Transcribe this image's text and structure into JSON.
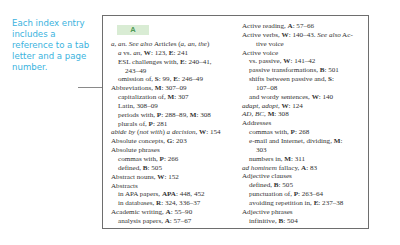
{
  "callout": {
    "text": "Each index entry includes a reference to a tab letter and a page number."
  },
  "index": {
    "tab_letter": "A",
    "left_column": [
      {
        "level": 0,
        "parts": [
          [
            "i",
            "a, an. See also "
          ],
          [
            "",
            "Articles ("
          ],
          [
            "i",
            "a, an, the"
          ],
          [
            "",
            ")"
          ]
        ]
      },
      {
        "level": 1,
        "parts": [
          [
            "i",
            "a"
          ],
          [
            "",
            " vs. "
          ],
          [
            "i",
            "an"
          ],
          [
            "",
            ", "
          ],
          [
            "b",
            "W"
          ],
          [
            "",
            ": 123, "
          ],
          [
            "b",
            "E"
          ],
          [
            "",
            ": 241"
          ]
        ]
      },
      {
        "level": 1,
        "parts": [
          [
            "",
            "ESL challenges with, "
          ],
          [
            "b",
            "E"
          ],
          [
            "",
            ": 240–41,"
          ]
        ]
      },
      {
        "level": 2,
        "parts": [
          [
            "",
            "243–49"
          ]
        ]
      },
      {
        "level": 1,
        "parts": [
          [
            "",
            "omission of, "
          ],
          [
            "b",
            "S"
          ],
          [
            "",
            ": 99, "
          ],
          [
            "b",
            "E"
          ],
          [
            "",
            ": 246–49"
          ]
        ]
      },
      {
        "level": 0,
        "parts": [
          [
            "",
            "Abbreviations, "
          ],
          [
            "b",
            "M"
          ],
          [
            "",
            ": 307–09"
          ]
        ]
      },
      {
        "level": 1,
        "parts": [
          [
            "",
            "capitalization of, "
          ],
          [
            "b",
            "M"
          ],
          [
            "",
            ": 307"
          ]
        ]
      },
      {
        "level": 1,
        "parts": [
          [
            "",
            "Latin, 308–09"
          ]
        ]
      },
      {
        "level": 1,
        "parts": [
          [
            "",
            "periods with, "
          ],
          [
            "b",
            "P"
          ],
          [
            "",
            ": 288–89, "
          ],
          [
            "b",
            "M"
          ],
          [
            "",
            ": 308"
          ]
        ]
      },
      {
        "level": 1,
        "parts": [
          [
            "",
            "plurals of, "
          ],
          [
            "b",
            "P"
          ],
          [
            "",
            ": 281"
          ]
        ]
      },
      {
        "level": 0,
        "parts": [
          [
            "i",
            "abide by"
          ],
          [
            "",
            " ("
          ],
          [
            "i",
            "not with"
          ],
          [
            "",
            ") "
          ],
          [
            "i",
            "a decision"
          ],
          [
            "",
            ", "
          ],
          [
            "b",
            "W"
          ],
          [
            "",
            ": 154"
          ]
        ]
      },
      {
        "level": 0,
        "parts": [
          [
            "",
            "Absolute concepts, "
          ],
          [
            "b",
            "G"
          ],
          [
            "",
            ": 203"
          ]
        ]
      },
      {
        "level": 0,
        "parts": [
          [
            "",
            "Absolute phrases"
          ]
        ]
      },
      {
        "level": 1,
        "parts": [
          [
            "",
            "commas with, "
          ],
          [
            "b",
            "P"
          ],
          [
            "",
            ": 266"
          ]
        ]
      },
      {
        "level": 1,
        "parts": [
          [
            "",
            "defined, "
          ],
          [
            "b",
            "B"
          ],
          [
            "",
            ": 505"
          ]
        ]
      },
      {
        "level": 0,
        "parts": [
          [
            "",
            "Abstract nouns, "
          ],
          [
            "b",
            "W"
          ],
          [
            "",
            ": 152"
          ]
        ]
      },
      {
        "level": 0,
        "parts": [
          [
            "",
            "Abstracts"
          ]
        ]
      },
      {
        "level": 1,
        "parts": [
          [
            "",
            "in APA papers, "
          ],
          [
            "b",
            "APA"
          ],
          [
            "",
            ": 448, 452"
          ]
        ]
      },
      {
        "level": 1,
        "parts": [
          [
            "",
            "in databases, "
          ],
          [
            "b",
            "R"
          ],
          [
            "",
            ": 324, 336–37"
          ]
        ]
      },
      {
        "level": 0,
        "parts": [
          [
            "",
            "Academic writing, "
          ],
          [
            "b",
            "A"
          ],
          [
            "",
            ": 55–90"
          ]
        ]
      },
      {
        "level": 1,
        "parts": [
          [
            "",
            "analysis papers, "
          ],
          [
            "b",
            "A"
          ],
          [
            "",
            ": 57–67"
          ]
        ]
      }
    ],
    "right_column": [
      {
        "level": 0,
        "parts": [
          [
            "",
            "Active reading, "
          ],
          [
            "b",
            "A"
          ],
          [
            "",
            ": 57–66"
          ]
        ]
      },
      {
        "level": 0,
        "parts": [
          [
            "",
            "Active verbs, "
          ],
          [
            "b",
            "W"
          ],
          [
            "",
            ": 140–43. "
          ],
          [
            "i",
            "See also"
          ],
          [
            "",
            " Ac-"
          ]
        ]
      },
      {
        "level": 2,
        "parts": [
          [
            "",
            "tive voice"
          ]
        ]
      },
      {
        "level": 0,
        "parts": [
          [
            "",
            "Active voice"
          ]
        ]
      },
      {
        "level": 1,
        "parts": [
          [
            "",
            "vs. passive, "
          ],
          [
            "b",
            "W"
          ],
          [
            "",
            ": 141–42"
          ]
        ]
      },
      {
        "level": 1,
        "parts": [
          [
            "",
            "passive transformations, "
          ],
          [
            "b",
            "B"
          ],
          [
            "",
            ": 501"
          ]
        ]
      },
      {
        "level": 1,
        "parts": [
          [
            "",
            "shifts between passive and, "
          ],
          [
            "b",
            "S"
          ],
          [
            "",
            ":"
          ]
        ]
      },
      {
        "level": 2,
        "parts": [
          [
            "",
            "107–08"
          ]
        ]
      },
      {
        "level": 1,
        "parts": [
          [
            "",
            "and wordy sentences, "
          ],
          [
            "b",
            "W"
          ],
          [
            "",
            ": 140"
          ]
        ]
      },
      {
        "level": 0,
        "parts": [
          [
            "i",
            "adapt, adopt"
          ],
          [
            "",
            ", "
          ],
          [
            "b",
            "W"
          ],
          [
            "",
            ": 124"
          ]
        ]
      },
      {
        "level": 0,
        "parts": [
          [
            "i",
            "AD, BC"
          ],
          [
            "",
            ", "
          ],
          [
            "b",
            "M"
          ],
          [
            "",
            ": 308"
          ]
        ]
      },
      {
        "level": 0,
        "parts": [
          [
            "",
            "Addresses"
          ]
        ]
      },
      {
        "level": 1,
        "parts": [
          [
            "",
            "commas with, "
          ],
          [
            "b",
            "P"
          ],
          [
            "",
            ": 268"
          ]
        ]
      },
      {
        "level": 1,
        "parts": [
          [
            "",
            "e-mail and Internet, dividing, "
          ],
          [
            "b",
            "M"
          ],
          [
            "",
            ":"
          ]
        ]
      },
      {
        "level": 2,
        "parts": [
          [
            "",
            "303"
          ]
        ]
      },
      {
        "level": 1,
        "parts": [
          [
            "",
            "numbers in, "
          ],
          [
            "b",
            "M"
          ],
          [
            "",
            ": 311"
          ]
        ]
      },
      {
        "level": 0,
        "parts": [
          [
            "i",
            "ad hominem"
          ],
          [
            "",
            " fallacy, "
          ],
          [
            "b",
            "A"
          ],
          [
            "",
            ": 83"
          ]
        ]
      },
      {
        "level": 0,
        "parts": [
          [
            "",
            "Adjective clauses"
          ]
        ]
      },
      {
        "level": 1,
        "parts": [
          [
            "",
            "defined, "
          ],
          [
            "b",
            "B"
          ],
          [
            "",
            ": 505"
          ]
        ]
      },
      {
        "level": 1,
        "parts": [
          [
            "",
            "punctuation of, "
          ],
          [
            "b",
            "P"
          ],
          [
            "",
            ": 263–64"
          ]
        ]
      },
      {
        "level": 1,
        "parts": [
          [
            "",
            "avoiding repetition in, "
          ],
          [
            "b",
            "E"
          ],
          [
            "",
            ": 237–38"
          ]
        ]
      },
      {
        "level": 0,
        "parts": [
          [
            "",
            "Adjective phrases"
          ]
        ]
      },
      {
        "level": 1,
        "parts": [
          [
            "",
            "infinitive, "
          ],
          [
            "b",
            "B"
          ],
          [
            "",
            ": 504"
          ]
        ]
      }
    ]
  },
  "colors": {
    "callout_text": "#3ab3de",
    "tab_bg": "#d9ecd4",
    "tab_text": "#4e9a55"
  }
}
